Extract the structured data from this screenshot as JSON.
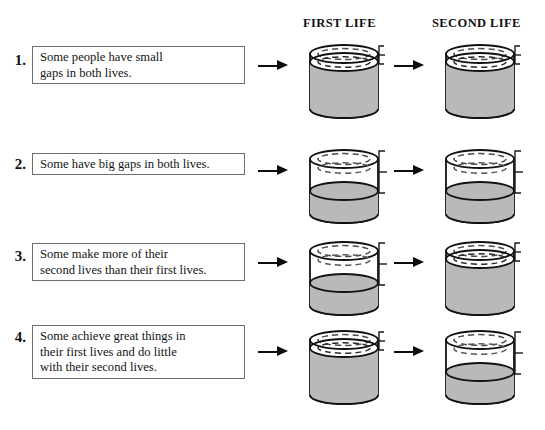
{
  "headers": {
    "first_life": "FIRST LIFE",
    "second_life": "SECOND LIFE"
  },
  "colors": {
    "fill_gray": "#b9b9b9",
    "outline": "#111111",
    "box_border": "#6e6e6e",
    "arrow": "#0d0d0d",
    "background": "#ffffff"
  },
  "rows": [
    {
      "number": "1.",
      "lines": [
        "Some people have small",
        "gaps in both lives."
      ],
      "text": "Some people have small gaps in both lives.",
      "first_life": {
        "gap": "small",
        "fill_percent": 85,
        "gap_percent": 15
      },
      "second_life": {
        "gap": "small",
        "fill_percent": 85,
        "gap_percent": 15
      }
    },
    {
      "number": "2.",
      "lines": [
        "Some have big gaps in both lives."
      ],
      "text": "Some have big gaps in both lives.",
      "first_life": {
        "gap": "big",
        "fill_percent": 50,
        "gap_percent": 50
      },
      "second_life": {
        "gap": "big",
        "fill_percent": 50,
        "gap_percent": 50
      }
    },
    {
      "number": "3.",
      "lines": [
        "Some make more of their",
        "second lives than their first lives."
      ],
      "text": "Some make more of their second lives than their first lives.",
      "first_life": {
        "gap": "big",
        "fill_percent": 50,
        "gap_percent": 50
      },
      "second_life": {
        "gap": "small",
        "fill_percent": 85,
        "gap_percent": 15
      }
    },
    {
      "number": "4.",
      "lines": [
        "Some achieve great things in",
        "their first lives and do little",
        "with their second lives."
      ],
      "text": "Some achieve great things in their first lives and do little with their second lives.",
      "first_life": {
        "gap": "small",
        "fill_percent": 85,
        "gap_percent": 15
      },
      "second_life": {
        "gap": "big",
        "fill_percent": 50,
        "gap_percent": 50
      }
    }
  ]
}
